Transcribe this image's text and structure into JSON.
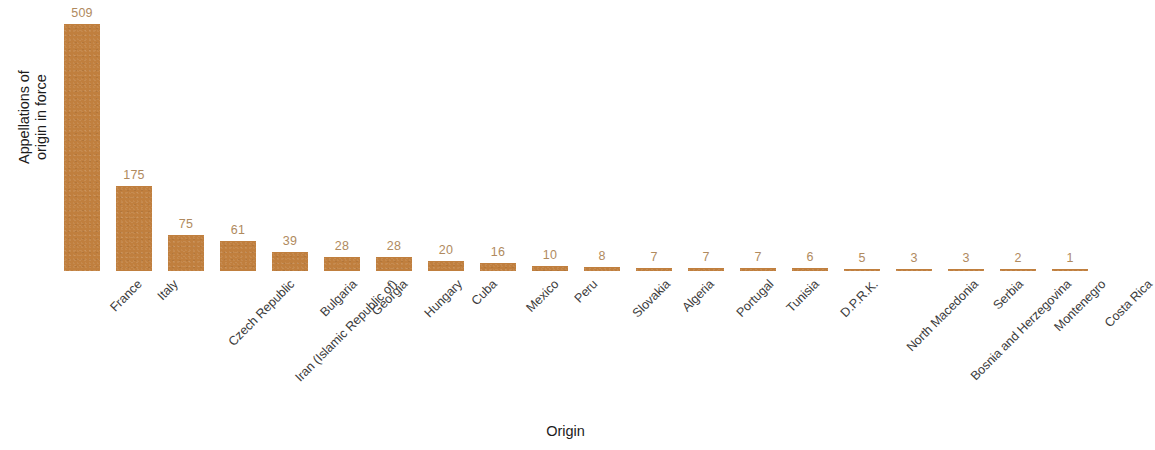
{
  "chart_data": {
    "type": "bar",
    "title": "",
    "subtitle": "",
    "xlabel": "Origin",
    "ylabel": "Appellations of\norigin in force",
    "ylim": [
      0,
      509
    ],
    "grid": false,
    "legend": null,
    "bar_color": "#c07f3e",
    "value_label_color": "#b08a5e",
    "axis_text_color": "#3c3c3c",
    "background": "#ffffff",
    "orientation": "vertical",
    "tick_label_rotation_deg": -45,
    "categories": [
      "France",
      "Italy",
      "Czech Republic",
      "Iran (Islamic Republic of)",
      "Bulgaria",
      "Georgia",
      "Hungary",
      "Cuba",
      "Mexico",
      "Peru",
      "Slovakia",
      "Algeria",
      "Portugal",
      "Tunisia",
      "D.P.R.K.",
      "North Macedonia",
      "Bosnia and Herzegovina",
      "Serbia",
      "Montenegro",
      "Costa Rica"
    ],
    "values": [
      509,
      175,
      75,
      61,
      39,
      28,
      28,
      20,
      16,
      10,
      8,
      7,
      7,
      7,
      6,
      5,
      3,
      3,
      2,
      1
    ],
    "value_labels": [
      "509",
      "175",
      "75",
      "61",
      "39",
      "28",
      "28",
      "20",
      "16",
      "10",
      "8",
      "7",
      "7",
      "7",
      "6",
      "5",
      "3",
      "3",
      "2",
      "1"
    ]
  }
}
